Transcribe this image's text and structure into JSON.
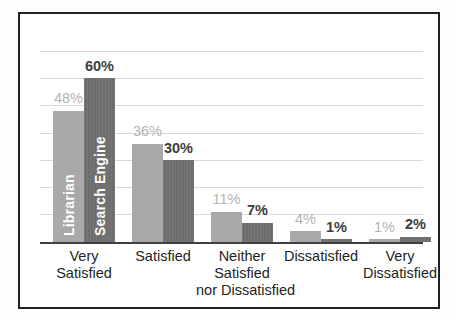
{
  "chart_data": {
    "type": "bar",
    "title": "",
    "subtitle": "",
    "xlabel": "",
    "ylabel": "",
    "ylim": [
      0,
      63
    ],
    "grid": true,
    "gridline_values": [
      7,
      14,
      21,
      28,
      35,
      42,
      49
    ],
    "legend_position": "inside-bars",
    "categories": [
      "Very Satisfied",
      "Satisfied",
      "Neither Satisfied nor Dissatisfied",
      "Dissatisfied",
      "Very Dissatisfied"
    ],
    "category_lines": [
      [
        "Very",
        "Satisfied"
      ],
      [
        "Satisfied"
      ],
      [
        "Neither",
        "Satisfied",
        "nor Dissatisfied"
      ],
      [
        "Dissatisfied"
      ],
      [
        "Very",
        "Dissatisfied"
      ]
    ],
    "series": [
      {
        "name": "Librarian",
        "color": "#a9a9a9",
        "label_color": "#b3b3b3",
        "values": [
          48,
          36,
          11,
          4,
          1
        ],
        "labels": [
          "48%",
          "36%",
          "11%",
          "4%",
          "1%"
        ]
      },
      {
        "name": "Search Engine",
        "color": "#6e6e6e",
        "label_color": "#3d3d3d",
        "values": [
          60,
          30,
          7,
          1,
          2
        ],
        "labels": [
          "60%",
          "30%",
          "7%",
          "1%",
          "2%"
        ]
      }
    ]
  },
  "frame": {
    "border_color": "#231f20",
    "background": "#ffffff"
  },
  "axis": {
    "baseline_color": "#404040",
    "gridline_color": "#d9d9d9"
  }
}
